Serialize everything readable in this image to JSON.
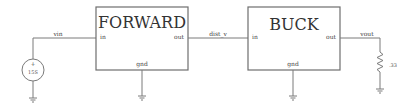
{
  "schematic": {
    "blocks": [
      {
        "id": "forward",
        "title": "FORWARD",
        "pins": {
          "in": "in",
          "out": "out",
          "gnd": "gnd"
        }
      },
      {
        "id": "buck",
        "title": "BUCK",
        "pins": {
          "in": "in",
          "out": "out",
          "gnd": "gnd"
        }
      }
    ],
    "nets": {
      "vin": "vin",
      "dist_v": "dist_v",
      "vout": "vout"
    },
    "source": {
      "polarity_plus": "+",
      "polarity_minus": "−",
      "value": "15S"
    },
    "load": {
      "value": ".33"
    },
    "colors": {
      "wire": "#7a7a7a",
      "box": "#6e6e6e",
      "text": "#333333"
    }
  }
}
